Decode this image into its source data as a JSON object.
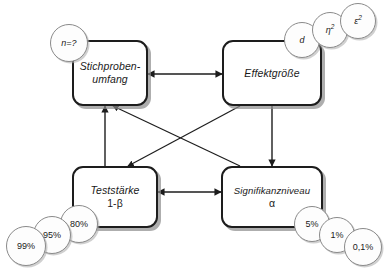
{
  "diagram": {
    "background_color": "#ffffff",
    "line_color": "#1d1d1d",
    "shadow_color": "#8c8c8c",
    "nodes": [
      {
        "id": "stichprobenumfang",
        "line1": "Stichproben-",
        "line2": "umfang"
      },
      {
        "id": "effektgroesse",
        "line1": "Effektgröße",
        "line2": ""
      },
      {
        "id": "teststaerke",
        "line1": "Teststärke",
        "line2": "1-β"
      },
      {
        "id": "signifikanzniveau",
        "line1": "Signifikanzniveau",
        "line2": "α"
      }
    ],
    "bubbles": {
      "sample_size": [
        {
          "id": "n-unknown",
          "label": "n=?"
        }
      ],
      "effect_size": [
        {
          "id": "cohens-d",
          "label": "d"
        },
        {
          "id": "eta-squared",
          "base": "η",
          "exp": "2"
        },
        {
          "id": "epsilon-squared",
          "base": "ε",
          "exp": "2"
        }
      ],
      "power": [
        {
          "id": "power-80",
          "label": "80%"
        },
        {
          "id": "power-95",
          "label": "95%"
        },
        {
          "id": "power-99",
          "label": "99%"
        }
      ],
      "alpha": [
        {
          "id": "alpha-5",
          "label": "5%"
        },
        {
          "id": "alpha-1",
          "label": "1%"
        },
        {
          "id": "alpha-01",
          "label": "0,1%"
        }
      ]
    },
    "edges": [
      {
        "id": "stichprobenumfang-effektgroesse",
        "type": "bidirectional"
      },
      {
        "id": "teststaerke-signifikanzniveau",
        "type": "bidirectional"
      },
      {
        "id": "teststaerke-stichprobenumfang",
        "type": "directed"
      },
      {
        "id": "signifikanzniveau-stichprobenumfang",
        "type": "directed"
      },
      {
        "id": "effektgroesse-teststaerke",
        "type": "directed"
      },
      {
        "id": "effektgroesse-signifikanzniveau",
        "type": "directed"
      }
    ]
  }
}
